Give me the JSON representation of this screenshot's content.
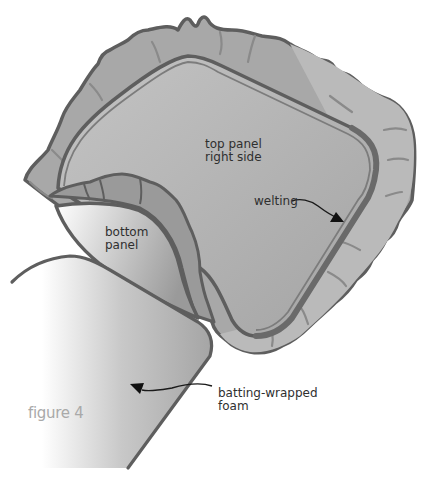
{
  "figure": {
    "caption": "figure 4",
    "labels": {
      "top_panel": [
        "top panel",
        "right side"
      ],
      "welting": "welting",
      "bottom_panel": [
        "bottom",
        "panel"
      ],
      "foam": [
        "batting-wrapped",
        "foam"
      ]
    },
    "colors": {
      "outline": "#5e5e5e",
      "ruffle_fill": "#a9a9a9",
      "ruffle_light": "#bdbdbd",
      "panel_fill": "#b4b4b4",
      "caption_text": "#a9a9a9",
      "label_text": "#2f2f2f"
    }
  }
}
